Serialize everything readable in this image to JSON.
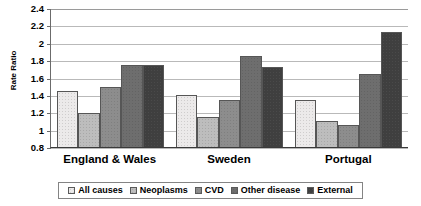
{
  "chart_data": {
    "type": "bar",
    "title": "",
    "xlabel": "",
    "ylabel": "Rate Ratio",
    "ylim": [
      0.8,
      2.4
    ],
    "ytick_step": 0.2,
    "yticks": [
      "2.4",
      "2.2",
      "2",
      "1.8",
      "1.6",
      "1.4",
      "1.2",
      "1",
      "0.8"
    ],
    "grid": true,
    "legend_position": "bottom",
    "categories": [
      "England & Wales",
      "Sweden",
      "Portugal"
    ],
    "series": [
      {
        "name": "All causes",
        "color": "#eceaea",
        "values": [
          1.45,
          1.4,
          1.35
        ]
      },
      {
        "name": "Neoplasms",
        "color": "#bdbdbd",
        "values": [
          1.2,
          1.15,
          1.1
        ]
      },
      {
        "name": "CVD",
        "color": "#8d8d8d",
        "values": [
          1.5,
          1.35,
          1.05
        ]
      },
      {
        "name": "Other disease",
        "color": "#6e6e6e",
        "values": [
          1.75,
          1.85,
          1.65
        ]
      },
      {
        "name": "External",
        "color": "#3f3f3f",
        "values": [
          1.75,
          1.73,
          2.13
        ]
      }
    ]
  }
}
